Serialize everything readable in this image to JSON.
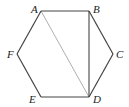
{
  "diagram": {
    "type": "regular-hexagon",
    "vertices": [
      {
        "label": "A",
        "x": 41,
        "y": 11,
        "lx": 31,
        "ly": 13
      },
      {
        "label": "B",
        "x": 89,
        "y": 11,
        "lx": 93,
        "ly": 13
      },
      {
        "label": "C",
        "x": 113,
        "y": 54,
        "lx": 116,
        "ly": 58
      },
      {
        "label": "D",
        "x": 89,
        "y": 97,
        "lx": 93,
        "ly": 103
      },
      {
        "label": "E",
        "x": 41,
        "y": 97,
        "lx": 29,
        "ly": 103
      },
      {
        "label": "F",
        "x": 17,
        "y": 54,
        "lx": 7,
        "ly": 58
      }
    ],
    "edges": [
      [
        "A",
        "B"
      ],
      [
        "B",
        "C"
      ],
      [
        "C",
        "D"
      ],
      [
        "D",
        "E"
      ],
      [
        "E",
        "F"
      ],
      [
        "F",
        "A"
      ]
    ],
    "diagonals": [
      {
        "from": "A",
        "to": "D",
        "color": "#9a9a9a"
      },
      {
        "from": "B",
        "to": "D",
        "color": "#555555"
      }
    ],
    "edge_color": "#444444"
  }
}
